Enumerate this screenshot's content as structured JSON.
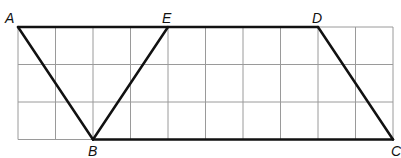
{
  "diagram": {
    "type": "geometry-grid",
    "grid": {
      "columns": 10,
      "rows": 3,
      "origin_x": 18,
      "origin_y": 27,
      "cell": 37.5,
      "line_color": "#9a9a9a"
    },
    "points": {
      "A": {
        "label": "A",
        "col": 0,
        "row": 0
      },
      "E": {
        "label": "E",
        "col": 4,
        "row": 0
      },
      "D": {
        "label": "D",
        "col": 8,
        "row": 0
      },
      "B": {
        "label": "B",
        "col": 2,
        "row": 3
      },
      "C": {
        "label": "C",
        "col": 10,
        "row": 3
      }
    },
    "segments": [
      [
        "A",
        "D"
      ],
      [
        "A",
        "B"
      ],
      [
        "B",
        "E"
      ],
      [
        "B",
        "C"
      ],
      [
        "D",
        "C"
      ]
    ],
    "stroke_color": "#111111"
  }
}
